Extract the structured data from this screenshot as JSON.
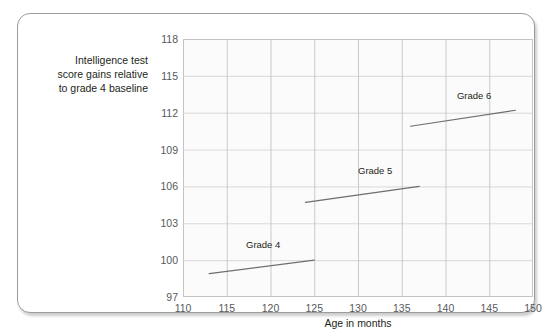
{
  "figure": {
    "background_color": "#ffffff",
    "card_border_color": "#9c9c9c",
    "plot_background_color": "#fbfbfb",
    "gridline_color": "#cfcfcf",
    "line_color": "#6d6e71",
    "tick_text_color": "#58595b"
  },
  "y_axis_title": {
    "line1": "Intelligence test",
    "line2": "score gains relative",
    "line3": "to grade 4 baseline"
  },
  "x_axis_title": "Age in months",
  "chart_data": {
    "type": "line",
    "title": "",
    "subtitle": "",
    "xlabel": "Age in months",
    "ylabel": "Intelligence test score gains relative to grade 4 baseline",
    "xlim": [
      110,
      150
    ],
    "ylim": [
      97,
      118
    ],
    "xticks": [
      110,
      115,
      120,
      125,
      130,
      135,
      140,
      145,
      150
    ],
    "yticks": [
      97,
      100,
      103,
      106,
      109,
      112,
      115,
      118
    ],
    "xtick_labels": [
      "110",
      "115",
      "120",
      "125",
      "130",
      "135",
      "140",
      "145",
      "150"
    ],
    "ytick_labels": [
      "97",
      "100",
      "103",
      "106",
      "109",
      "112",
      "115",
      "118"
    ],
    "grid": true,
    "legend": "inline-labels",
    "series": [
      {
        "name": "Grade 4",
        "label": "Grade 4",
        "label_x": 117.2,
        "label_y": 101.2,
        "x": [
          113.0,
          125.0
        ],
        "y": [
          98.9,
          100.0
        ]
      },
      {
        "name": "Grade 5",
        "label": "Grade 5",
        "label_x": 130.0,
        "label_y": 107.3,
        "x": [
          124.0,
          137.0
        ],
        "y": [
          104.7,
          106.0
        ]
      },
      {
        "name": "Grade 6",
        "label": "Grade 6",
        "label_x": 141.3,
        "label_y": 113.4,
        "x": [
          136.0,
          148.0
        ],
        "y": [
          110.9,
          112.2
        ]
      }
    ]
  }
}
